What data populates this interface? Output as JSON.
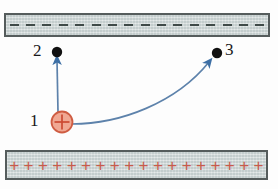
{
  "figure": {
    "background_color": "#fdfdfd"
  },
  "top_plate": {
    "name": "negative-plate",
    "charge_symbol": "−",
    "charge_count": 16,
    "fill_color": "#c9d2d2",
    "border_color": "#555c5c",
    "symbol_color": "#3f4a48",
    "x": 4,
    "y": 13,
    "width": 266,
    "height": 24
  },
  "bottom_plate": {
    "name": "positive-plate",
    "charge_symbol": "+",
    "charge_count": 18,
    "fill_color": "#c9d2d2",
    "border_color": "#555c5c",
    "symbol_color": "#c85a4a",
    "x": 5,
    "y": 150,
    "width": 263,
    "height": 30
  },
  "charge": {
    "label": "1",
    "symbol": "+",
    "fill_color": "#f0a893",
    "border_color": "#cf5c42",
    "symbol_color": "#cc4a33",
    "cx": 62,
    "cy": 122,
    "r": 11
  },
  "points": [
    {
      "label": "2",
      "cx": 57,
      "cy": 52,
      "color": "#111111"
    },
    {
      "label": "3",
      "cx": 217,
      "cy": 53,
      "color": "#111111"
    }
  ],
  "arrows": [
    {
      "name": "straight-arrow-1-to-2",
      "from": "1",
      "to": "2",
      "color": "#3d6fa5",
      "shape": "straight",
      "x1": 58,
      "y1": 112,
      "x2": 57,
      "y2": 58
    },
    {
      "name": "curved-arrow-1-to-3",
      "from": "1",
      "to": "3",
      "color": "#3d6fa5",
      "shape": "curved",
      "x1": 72,
      "y1": 124,
      "x2": 212,
      "y2": 58
    }
  ],
  "colors": {
    "arrow_blue": "#3d6fa5",
    "charge_red": "#cc4a33",
    "plate_gray": "#c9d2d2",
    "plate_border": "#555c5c"
  }
}
